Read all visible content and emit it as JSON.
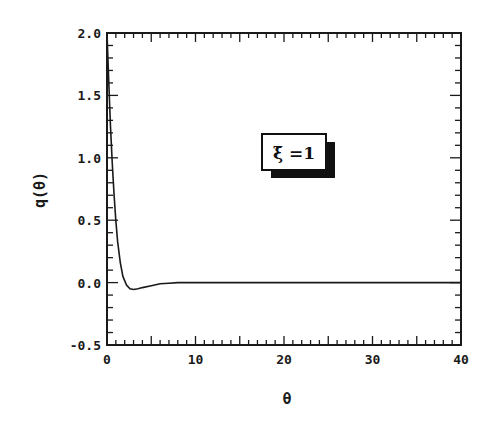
{
  "chart_data": {
    "type": "line",
    "title": "",
    "xlabel": "θ",
    "ylabel": "q(θ)",
    "xlim": [
      0,
      40
    ],
    "ylim": [
      -0.5,
      2.0
    ],
    "x_ticks": [
      "0",
      "10",
      "20",
      "30",
      "40"
    ],
    "y_ticks": [
      "-0.5",
      "0.0",
      "0.5",
      "1.0",
      "1.5",
      "2.0"
    ],
    "grid": false,
    "annotation": "ξ̄ =1",
    "series": [
      {
        "name": "q(θ)",
        "x": [
          0,
          0.2,
          0.4,
          0.6,
          0.8,
          1.0,
          1.2,
          1.5,
          1.8,
          2.2,
          2.6,
          3.0,
          3.5,
          4.0,
          5.0,
          6.0,
          7.0,
          8.0,
          10,
          15,
          20,
          25,
          30,
          35,
          40
        ],
        "values": [
          2.0,
          1.6,
          1.25,
          0.95,
          0.7,
          0.5,
          0.33,
          0.16,
          0.05,
          -0.02,
          -0.05,
          -0.055,
          -0.05,
          -0.04,
          -0.025,
          -0.01,
          -0.005,
          0.0,
          0.0,
          0.0,
          0.0,
          0.0,
          0.0,
          0.0,
          0.0
        ]
      }
    ]
  },
  "axes": {
    "x_title": "θ",
    "y_title": "q(θ)"
  },
  "legend": {
    "label": "ξ̄ =1"
  }
}
